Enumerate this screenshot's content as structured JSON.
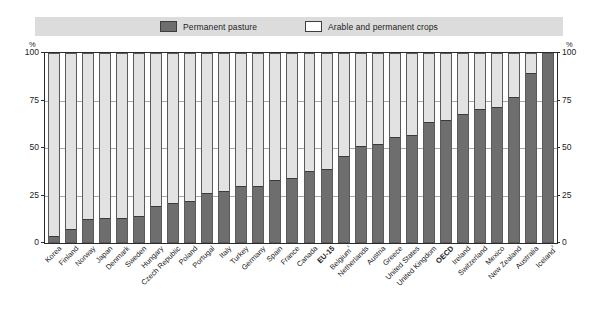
{
  "legend": {
    "entries": [
      {
        "label": "Permanent pasture",
        "color": "#6e6e6e",
        "name": "permanent-pasture"
      },
      {
        "label": "Arable and permanent crops",
        "color": "#ffffff",
        "name": "arable-and-permanent-crops"
      }
    ]
  },
  "axis": {
    "unit_left": "%",
    "unit_right": "%",
    "ticks": [
      "100",
      "75",
      "50",
      "25",
      "0"
    ]
  },
  "chart_data": {
    "type": "bar",
    "title": "",
    "subtitle": "",
    "xlabel": "",
    "ylabel": "%",
    "ylim": [
      0,
      100
    ],
    "yticks": [
      0,
      25,
      50,
      75,
      100
    ],
    "grid": true,
    "legend_position": "top",
    "stacked": true,
    "note": "Stacked 100% bars: share of permanent pasture vs arable and permanent crops in total agricultural land.",
    "categories": [
      "Korea",
      "Finland",
      "Norway",
      "Japan",
      "Denmark",
      "Sweden",
      "Hungary",
      "Czech Republic",
      "Poland",
      "Portugal",
      "Italy",
      "Turkey",
      "Germany",
      "Spain",
      "France",
      "Canada",
      "EU-15",
      "Belgium¹",
      "Netherlands",
      "Austria",
      "Greece",
      "United States",
      "United Kingdom",
      "OECD",
      "Ireland",
      "Switzerland",
      "Mexico",
      "New Zealand",
      "Australia",
      "Iceland²"
    ],
    "series": [
      {
        "name": "Permanent pasture",
        "color": "#6e6e6e",
        "values": [
          3,
          7,
          12,
          13,
          13,
          14,
          19,
          21,
          22,
          26,
          27,
          30,
          30,
          33,
          34,
          38,
          39,
          46,
          51,
          52,
          56,
          57,
          64,
          65,
          68,
          71,
          72,
          77,
          90,
          100
        ]
      },
      {
        "name": "Arable and permanent crops",
        "color": "#ffffff",
        "values": [
          97,
          93,
          88,
          87,
          87,
          86,
          81,
          79,
          78,
          74,
          73,
          70,
          70,
          67,
          66,
          62,
          61,
          54,
          49,
          48,
          44,
          43,
          36,
          35,
          32,
          29,
          28,
          23,
          10,
          0
        ]
      }
    ],
    "bold_categories": [
      "EU-15",
      "OECD"
    ]
  }
}
